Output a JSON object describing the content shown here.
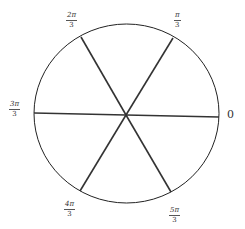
{
  "diagram": {
    "title": "",
    "center": {
      "x": 126,
      "y": 115
    },
    "circle": {
      "cx": 126.5,
      "cy": 113.5,
      "rx": 92.5,
      "ry": 89.5,
      "stroke": "#222222"
    },
    "spoke_color": "#333333",
    "labels": {
      "zero": "0",
      "pi_3": {
        "num": "π",
        "den": "3"
      },
      "two_pi_3": {
        "num": "2π",
        "den": "3"
      },
      "three_pi_3": {
        "num": "3π",
        "den": "3"
      },
      "four_pi_3": {
        "num": "4π",
        "den": "3"
      },
      "five_pi_3": {
        "num": "5π",
        "den": "3"
      }
    },
    "spokes": [
      {
        "angle": "0",
        "x": 219,
        "y": 117
      },
      {
        "angle": "π/3",
        "x": 173,
        "y": 38
      },
      {
        "angle": "2π/3",
        "x": 81,
        "y": 37
      },
      {
        "angle": "3π/3",
        "x": 34,
        "y": 113
      },
      {
        "angle": "4π/3",
        "x": 80,
        "y": 191
      },
      {
        "angle": "5π/3",
        "x": 171,
        "y": 192
      }
    ]
  }
}
